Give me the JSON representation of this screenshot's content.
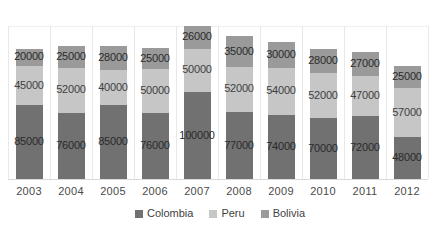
{
  "chart_data": {
    "type": "bar",
    "subtype": "stacked-column",
    "title": "",
    "xlabel": "",
    "ylabel": "",
    "grid": "vertical-category-separators",
    "legend_position": "bottom-center",
    "categories": [
      "2003",
      "2004",
      "2005",
      "2006",
      "2007",
      "2008",
      "2009",
      "2010",
      "2011",
      "2012"
    ],
    "series": [
      {
        "name": "Colombia",
        "color": "#717171",
        "values": [
          85000,
          76000,
          85000,
          76000,
          100000,
          77000,
          74000,
          70000,
          72000,
          48000
        ]
      },
      {
        "name": "Peru",
        "color": "#c6c6c6",
        "values": [
          45000,
          52000,
          40000,
          50000,
          50000,
          52000,
          54000,
          52000,
          47000,
          57000
        ]
      },
      {
        "name": "Bolivia",
        "color": "#9a9a9a",
        "values": [
          20000,
          25000,
          28000,
          25000,
          26000,
          35000,
          30000,
          28000,
          27000,
          25000
        ]
      }
    ],
    "totals": [
      150000,
      153000,
      153000,
      151000,
      176000,
      164000,
      158000,
      150000,
      146000,
      130000
    ],
    "ylim": [
      0,
      176000
    ],
    "data_labels_shown": true
  },
  "legend": {
    "items": [
      {
        "label": "Colombia",
        "color": "#717171"
      },
      {
        "label": "Peru",
        "color": "#c6c6c6"
      },
      {
        "label": "Bolivia",
        "color": "#9a9a9a"
      }
    ]
  }
}
